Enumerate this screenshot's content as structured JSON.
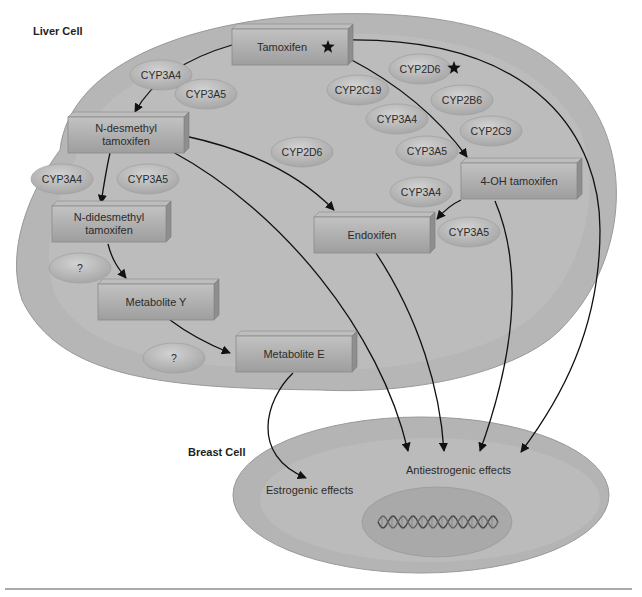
{
  "diagram": {
    "liver_cell": {
      "title": "Liver Cell"
    },
    "breast_cell": {
      "title": "Breast Cell",
      "estrogenic_label": "Estrogenic effects",
      "antiestrogenic_label": "Antiestrogenic effects",
      "nucleus_icon": "dna-helix-icon"
    },
    "compounds": [
      {
        "id": "tamoxifen",
        "line1": "Tamoxifen",
        "line2": "",
        "starred": true
      },
      {
        "id": "n_desmethyl",
        "line1": "N-desmethyl",
        "line2": "tamoxifen",
        "starred": false
      },
      {
        "id": "n_didesmethyl",
        "line1": "N-didesmethyl",
        "line2": "tamoxifen",
        "starred": false
      },
      {
        "id": "metabolite_y",
        "line1": "Metabolite Y",
        "line2": "",
        "starred": false
      },
      {
        "id": "metabolite_e",
        "line1": "Metabolite E",
        "line2": "",
        "starred": false
      },
      {
        "id": "endoxifen",
        "line1": "Endoxifen",
        "line2": "",
        "starred": false
      },
      {
        "id": "oh_tamoxifen",
        "line1": "4-OH tamoxifen",
        "line2": "",
        "starred": false
      }
    ],
    "enzymes": [
      {
        "label": "CYP3A4",
        "starred": false
      },
      {
        "label": "CYP3A5",
        "starred": false
      },
      {
        "label": "CYP2D6",
        "starred": true
      },
      {
        "label": "CYP2C19",
        "starred": false
      },
      {
        "label": "CYP2B6",
        "starred": false
      },
      {
        "label": "CYP3A4",
        "starred": false
      },
      {
        "label": "CYP2C9",
        "starred": false
      },
      {
        "label": "CYP3A5",
        "starred": false
      },
      {
        "label": "CYP2D6",
        "starred": false
      },
      {
        "label": "CYP3A4",
        "starred": false
      },
      {
        "label": "CYP3A5",
        "starred": false
      },
      {
        "label": "CYP3A4",
        "starred": false
      },
      {
        "label": "CYP3A5",
        "starred": false
      },
      {
        "label": "?",
        "starred": false
      },
      {
        "label": "?",
        "starred": false
      }
    ],
    "pathways": [
      {
        "from": "Tamoxifen",
        "to": "N-desmethyl tamoxifen"
      },
      {
        "from": "Tamoxifen",
        "to": "4-OH tamoxifen"
      },
      {
        "from": "Tamoxifen",
        "to": "Antiestrogenic effects"
      },
      {
        "from": "N-desmethyl tamoxifen",
        "to": "N-didesmethyl tamoxifen"
      },
      {
        "from": "N-desmethyl tamoxifen",
        "to": "Endoxifen"
      },
      {
        "from": "N-desmethyl tamoxifen",
        "to": "Antiestrogenic effects"
      },
      {
        "from": "4-OH tamoxifen",
        "to": "Endoxifen"
      },
      {
        "from": "4-OH tamoxifen",
        "to": "Antiestrogenic effects"
      },
      {
        "from": "Endoxifen",
        "to": "Antiestrogenic effects"
      },
      {
        "from": "N-didesmethyl tamoxifen",
        "to": "Metabolite Y"
      },
      {
        "from": "Metabolite Y",
        "to": "Metabolite E"
      },
      {
        "from": "Metabolite E",
        "to": "Estrogenic effects"
      }
    ],
    "colors": {
      "cell_fill": "#b8b8b8",
      "cell_inner": "#c4c4c4",
      "box_fill": "#a9a9a9",
      "enzyme_fill": "#b3b3b3",
      "arrow": "#111111"
    }
  }
}
